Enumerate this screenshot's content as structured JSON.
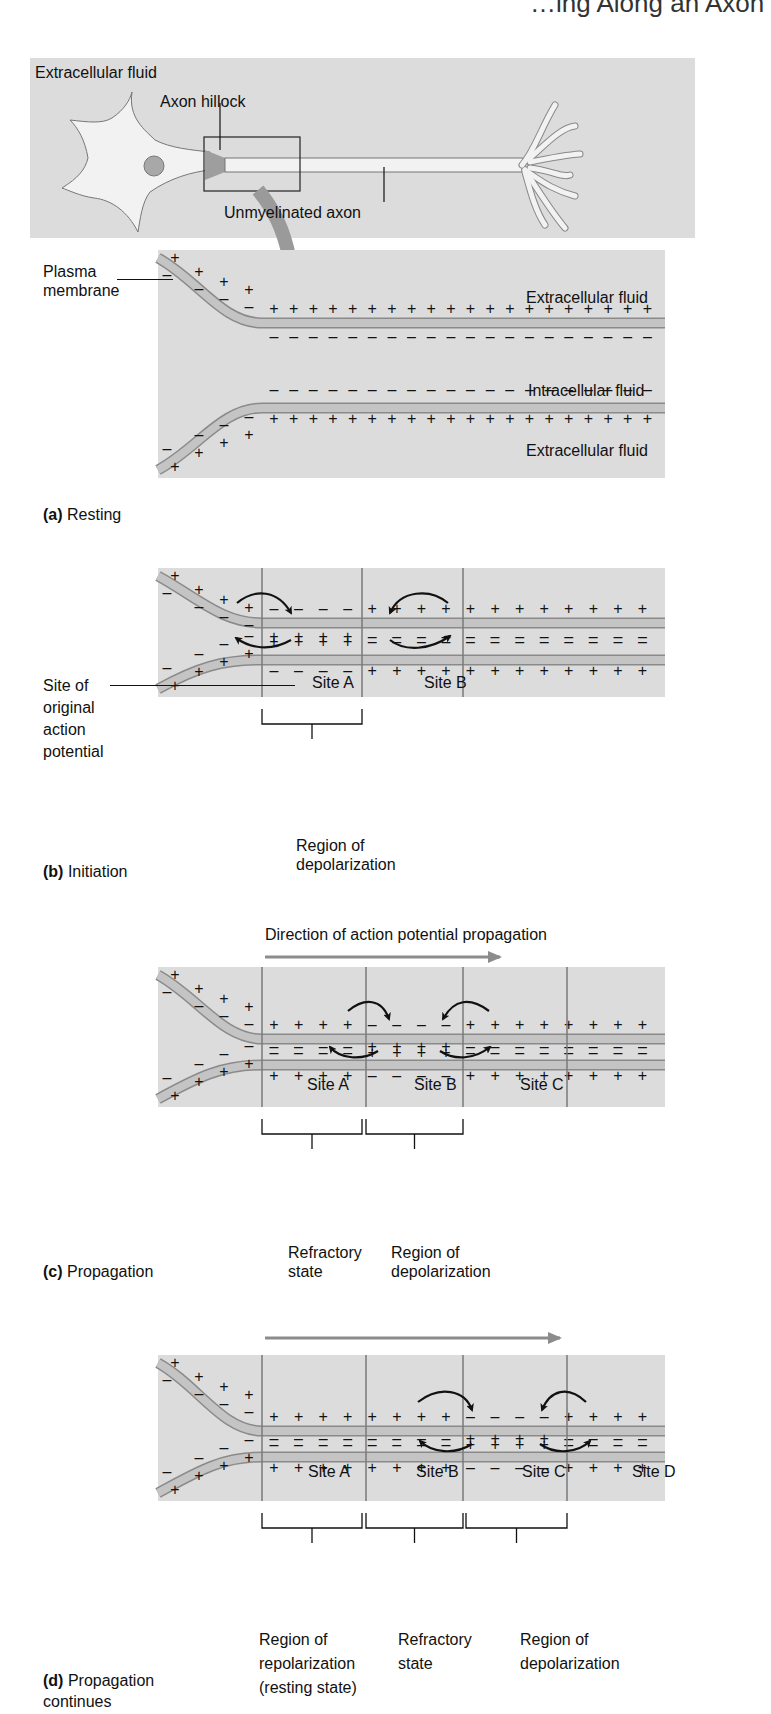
{
  "header": {
    "partial_text": "…ing Along an Axon"
  },
  "overview": {
    "labels": {
      "extracellular": "Extracellular fluid",
      "axon_hillock": "Axon hillock",
      "unmyelinated": "Unmyelinated axon"
    }
  },
  "panels": {
    "a": {
      "letter": "(a)",
      "title": "Resting",
      "plasma_membrane": "Plasma\nmembrane",
      "extracellular_top": "Extracellular fluid",
      "intracellular": "Intracellular fluid",
      "extracellular_bottom": "Extracellular fluid",
      "outer_top": "++++++++++++++++++++",
      "inner_top": "--------------------"
    },
    "b": {
      "letter": "(b)",
      "title": "Initiation",
      "site_of": "Site of\noriginal\naction\npotential",
      "sites": [
        "Site A",
        "Site B"
      ],
      "bracket": "Region of\ndepolarization",
      "outer_top": [
        "-",
        "-",
        "-",
        "-",
        "+",
        "+",
        "+",
        "+",
        "+",
        "+",
        "+",
        "+",
        "+",
        "+",
        "+",
        "+"
      ],
      "inner_top": [
        "+",
        "+",
        "+",
        "+",
        "-",
        "-",
        "-",
        "-",
        "-",
        "-",
        "-",
        "-",
        "-",
        "-",
        "-",
        "-"
      ]
    },
    "c": {
      "letter": "(c)",
      "title": "Propagation",
      "direction": "Direction of action potential propagation",
      "sites": [
        "Site A",
        "Site B",
        "Site C"
      ],
      "brackets": [
        "Refractory\nstate",
        "Region of\ndepolarization"
      ],
      "outer_top": [
        "+",
        "+",
        "+",
        "+",
        "-",
        "-",
        "-",
        "-",
        "+",
        "+",
        "+",
        "+",
        "+",
        "+",
        "+",
        "+"
      ],
      "inner_top": [
        "-",
        "-",
        "-",
        "-",
        "+",
        "+",
        "+",
        "+",
        "-",
        "-",
        "-",
        "-",
        "-",
        "-",
        "-",
        "-"
      ]
    },
    "d": {
      "letter": "(d)",
      "title": "Propagation\ncontinues",
      "sites": [
        "Site A",
        "Site B",
        "Site C",
        "Site D"
      ],
      "brackets": [
        "Region of\nrepolarization\n(resting state)",
        "Refractory\nstate",
        "Region of\ndepolarization"
      ],
      "outer_top": [
        "+",
        "+",
        "+",
        "+",
        "+",
        "+",
        "+",
        "+",
        "-",
        "-",
        "-",
        "-",
        "+",
        "+",
        "+",
        "+"
      ],
      "inner_top": [
        "-",
        "-",
        "-",
        "-",
        "-",
        "-",
        "-",
        "-",
        "+",
        "+",
        "+",
        "+",
        "-",
        "-",
        "-",
        "-"
      ]
    }
  },
  "colors": {
    "panel_bg": "#dcdcdc",
    "membrane": "#c4c4c4",
    "membrane_edge": "#8a8a8a",
    "arrow_gray": "#8c8c8c",
    "divider": "#7a7a7a",
    "text": "#111111"
  }
}
